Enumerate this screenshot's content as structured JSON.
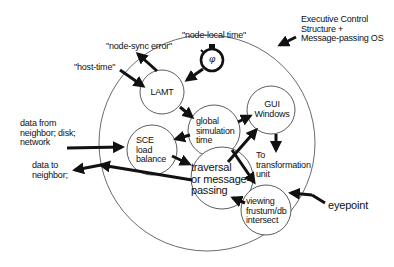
{
  "diagram": {
    "container": {
      "label_lines": [
        "Executive Control",
        "Structure +",
        "Message-passing OS"
      ]
    },
    "nodes": {
      "lamt": {
        "label": "LAMT"
      },
      "clock": {
        "label": "φ",
        "icon": "stopwatch-icon"
      },
      "global_sim_time": {
        "lines": [
          "global",
          "simulation",
          "time"
        ]
      },
      "gui_windows": {
        "lines": [
          "GUI",
          "Windows"
        ]
      },
      "sce_load_balance": {
        "lines": [
          "SCE",
          "load",
          "balance"
        ]
      },
      "traversal": {
        "lines": [
          "traversal",
          "or message-",
          "passing"
        ]
      },
      "viewing_frustum": {
        "lines": [
          "viewing",
          "frustum/db",
          "intersect"
        ]
      }
    },
    "external_labels": {
      "node_sync_error": "\"node-sync error\"",
      "node_local_time": "\"node-local time\"",
      "host_time": "\"host-time\"",
      "data_from_lines": [
        "data from",
        "neighbor; disk;",
        "network"
      ],
      "data_to_lines": [
        "data to",
        "neighbor;"
      ],
      "to_transformation_lines": [
        "To",
        "transformation",
        "unit"
      ],
      "eyepoint": "eyepoint"
    },
    "edges": [
      {
        "from": "LAMT",
        "to": "node-sync error"
      },
      {
        "from": "host-time",
        "to": "LAMT"
      },
      {
        "from": "stopwatch",
        "to": "LAMT"
      },
      {
        "from": "LAMT",
        "to": "global simulation time"
      },
      {
        "from": "global simulation time",
        "to": "GUI Windows"
      },
      {
        "from": "global simulation time",
        "to": "SCE load balance"
      },
      {
        "from": "global simulation time",
        "to": "viewing frustum/db intersect"
      },
      {
        "from": "GUI Windows",
        "to": "To transformation unit"
      },
      {
        "from": "traversal or message-passing",
        "to": "GUI Windows"
      },
      {
        "from": "data from neighbor; disk; network",
        "to": "SCE load balance"
      },
      {
        "from": "SCE load balance",
        "to": "traversal or message-passing"
      },
      {
        "from": "traversal or message-passing",
        "to": "data to neighbor;"
      },
      {
        "from": "viewing frustum/db intersect",
        "to": "traversal or message-passing"
      },
      {
        "from": "eyepoint",
        "to": "viewing frustum/db intersect"
      },
      {
        "from": "Executive Control Structure + Message-passing OS",
        "to": "container circle"
      }
    ],
    "colors": {
      "ink": "#111111",
      "background": "#ffffff"
    }
  }
}
